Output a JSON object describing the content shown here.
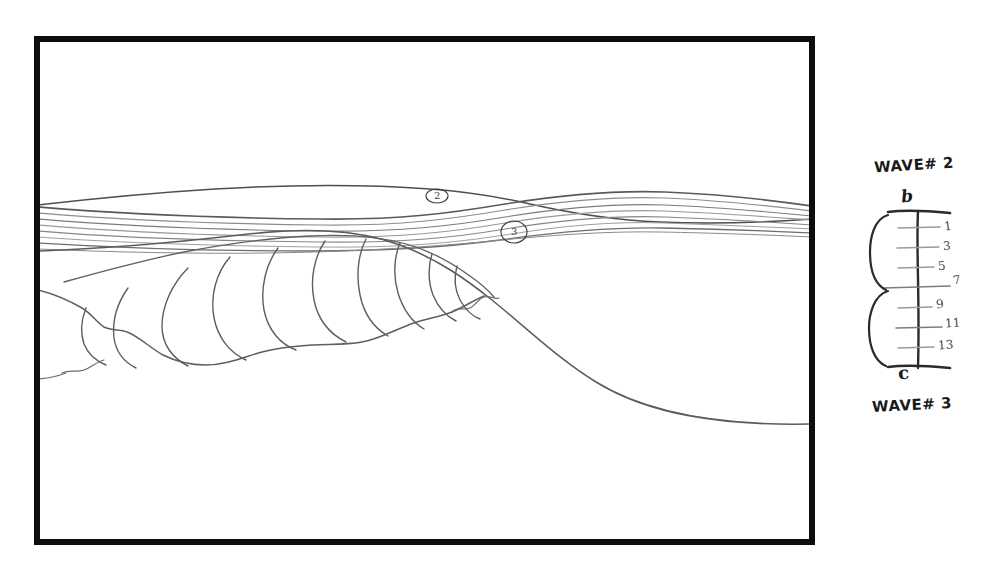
{
  "canvas": {
    "width": 987,
    "height": 566,
    "background_color": "#ffffff",
    "media": "pencil-and-ink-sketch-on-white-paper"
  },
  "frame": {
    "name": "storyboard-frame",
    "stroke_color": "#0d0d0d",
    "x": 34,
    "y": 36,
    "width": 781,
    "height": 509,
    "border_px": 6
  },
  "artwork": {
    "title": "breaking-ocean-wave-cross-section",
    "description": "Hand drawn profile of a breaking ocean wave: a long crest line across the top, a band of parallel flow streak lines, a lobed foam-roll along the curling lip, and a smooth wave face descending to the lower right.",
    "line_color": "#555555",
    "streak_color": "#8a8a8a",
    "stroke_color_dark": "#4a4a4a"
  },
  "annotations": {
    "circled": [
      {
        "label": "2",
        "name": "callout-circle-2",
        "x": 437,
        "y": 196
      },
      {
        "label": "3",
        "name": "callout-circle-3",
        "x": 514,
        "y": 232
      }
    ]
  },
  "scale": {
    "name": "wave-interval-scale",
    "top_label": "WAVE# 2",
    "bottom_label": "WAVE# 3",
    "top_point_label": "b",
    "bottom_point_label": "c",
    "spine_color": "#2b2b2b",
    "tick_color": "#9a9a9a",
    "axis_x": 918,
    "axis_top_y": 212,
    "axis_bottom_y": 367,
    "end_bar_width": 62,
    "ticks": [
      {
        "value": "1",
        "y": 228
      },
      {
        "value": "3",
        "y": 248
      },
      {
        "value": "5",
        "y": 268
      },
      {
        "value": "7",
        "y": 288
      },
      {
        "value": "9",
        "y": 308
      },
      {
        "value": "11",
        "y": 328
      },
      {
        "value": "13",
        "y": 348
      }
    ],
    "braces": [
      {
        "name": "upper-brace",
        "top_y": 214,
        "bottom_y": 290
      },
      {
        "name": "lower-brace",
        "top_y": 290,
        "bottom_y": 366
      }
    ]
  }
}
